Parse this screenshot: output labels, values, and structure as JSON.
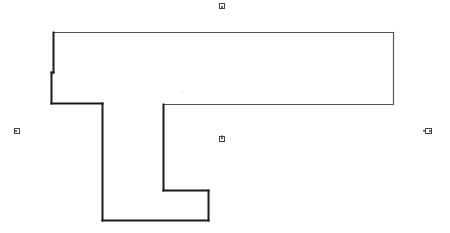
{
  "diagram": {
    "type": "floor-plan",
    "width": 450,
    "height": 233,
    "background": "#ffffff",
    "outline": {
      "stroke": "#1a1a1a",
      "stroke_light": "#555555",
      "points": [
        [
          53,
          32
        ],
        [
          393,
          32
        ],
        [
          393,
          104
        ],
        [
          163,
          104
        ],
        [
          163,
          190
        ],
        [
          208,
          190
        ],
        [
          208,
          220
        ],
        [
          102,
          220
        ],
        [
          102,
          103
        ],
        [
          51,
          103
        ],
        [
          51,
          72
        ],
        [
          53,
          72
        ],
        [
          53,
          32
        ]
      ]
    },
    "markers": [
      {
        "id": "top",
        "name": "door-marker-top",
        "x": 219,
        "y": 3,
        "w": 6,
        "h": 6,
        "orientation": "down"
      },
      {
        "id": "left",
        "name": "door-marker-left",
        "x": 14,
        "y": 128,
        "w": 6,
        "h": 6,
        "orientation": "right"
      },
      {
        "id": "right",
        "name": "door-marker-right",
        "x": 425,
        "y": 128,
        "w": 7,
        "h": 6,
        "orientation": "left"
      },
      {
        "id": "center",
        "name": "room-marker-center",
        "x": 219,
        "y": 136,
        "w": 6,
        "h": 6,
        "orientation": "up"
      }
    ],
    "artifacts": [
      {
        "name": "faint-dot",
        "x": 182,
        "y": 91
      }
    ]
  }
}
